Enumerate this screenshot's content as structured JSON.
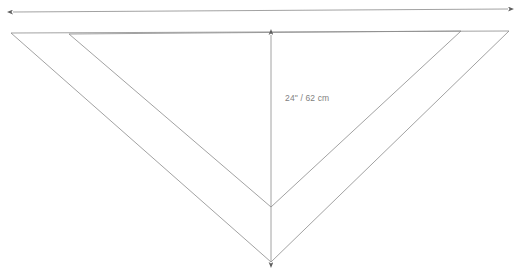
{
  "diagram": {
    "background_color": "#ffffff",
    "line_color": "#8a8a8a",
    "arrow_color": "#6b6b6b",
    "label_color": "#818181",
    "line_width": 0.8,
    "labels": {
      "height": "24\" / 62 cm",
      "width": ""
    },
    "dimension_lines": [
      {
        "name": "width-dimension-arrow",
        "orientation": "horizontal",
        "double_headed": true,
        "label": "",
        "from": [
          13,
          12
        ],
        "to": [
          508,
          9
        ]
      },
      {
        "name": "height-dimension-arrow",
        "orientation": "vertical",
        "double_headed": true,
        "label": "24\" / 62 cm",
        "from": [
          271,
          35
        ],
        "to": [
          271,
          262
        ]
      }
    ],
    "shapes": [
      {
        "name": "outer-triangle",
        "points": [
          [
            11,
            33
          ],
          [
            509,
            31
          ],
          [
            271,
            262
          ]
        ]
      },
      {
        "name": "inner-triangle",
        "points": [
          [
            69,
            34
          ],
          [
            461,
            31
          ],
          [
            271,
            207
          ]
        ]
      }
    ]
  },
  "chart_data": {
    "type": "table",
    "xlabel": "",
    "ylabel": "",
    "categories": [
      "height"
    ],
    "values": [
      24
    ],
    "annotations": [
      "24\" / 62 cm"
    ]
  }
}
